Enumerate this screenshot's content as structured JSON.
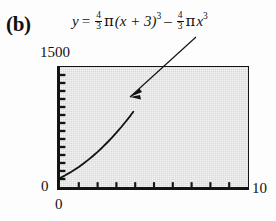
{
  "figure": {
    "panel_label": "(b)",
    "equation": {
      "lhs": "y",
      "equals": "=",
      "term1": {
        "frac_num": "4",
        "frac_den": "3",
        "pi": "π",
        "base": "(x + 3)",
        "exponent": "3"
      },
      "minus": "–",
      "term2": {
        "frac_num": "4",
        "frac_den": "3",
        "pi": "π",
        "base": "x",
        "exponent": "3"
      },
      "plain_text": "y = 4/3 π(x + 3)^3 – 4/3 π x^3"
    },
    "annotation": {
      "name": "curve-leader-arrow",
      "points_to": "graph curve"
    }
  },
  "axes": {
    "y_max_label": "1500",
    "y_min_label": "0",
    "x_min_label": "0",
    "x_max_label": "10"
  },
  "colors": {
    "plot_fill": "#d9d9d9",
    "frame": "#141414",
    "curve": "#141414",
    "page_background": "#fdfdfd"
  },
  "chart_data": {
    "type": "line",
    "title": "",
    "xlabel": "",
    "ylabel": "",
    "xlim": [
      0,
      10
    ],
    "ylim": [
      0,
      1500
    ],
    "grid": true,
    "legend": null,
    "x_ticks": [
      0,
      1,
      2,
      3,
      4,
      5,
      6,
      7,
      8,
      9,
      10
    ],
    "y_ticks": [
      0,
      100,
      200,
      300,
      400,
      500,
      600,
      700,
      800,
      900,
      1000,
      1100,
      1200,
      1300,
      1400,
      1500
    ],
    "x_tick_labels": [
      "0",
      "",
      "",
      "",
      "",
      "",
      "",
      "",
      "",
      "",
      "10"
    ],
    "y_tick_labels": [
      "0",
      "",
      "",
      "",
      "",
      "",
      "",
      "",
      "",
      "",
      "",
      "",
      "",
      "",
      "",
      "1500"
    ],
    "series": [
      {
        "name": "y = 4/3 π(x + 3)^3 – 4/3 π x^3",
        "style": "solid",
        "x": [
          0,
          0.25,
          0.5,
          0.75,
          1,
          1.25,
          1.5,
          1.75,
          2,
          2.25,
          2.5,
          2.75,
          3,
          3.25,
          3.5,
          3.75,
          3.9
        ],
        "values": [
          113,
          143,
          176,
          212,
          251,
          293,
          339,
          387,
          439,
          494,
          553,
          614,
          679,
          747,
          819,
          893,
          940
        ]
      }
    ]
  }
}
